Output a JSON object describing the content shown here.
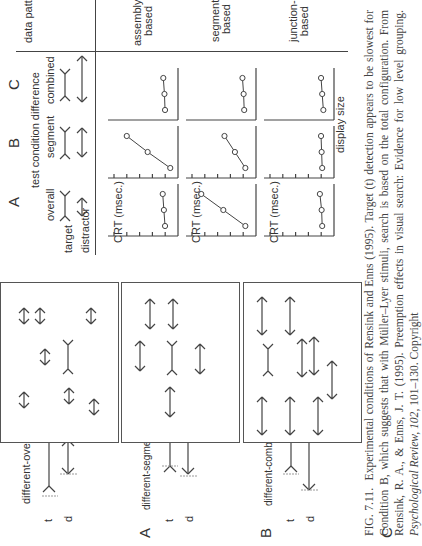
{
  "figure": {
    "conditions": [
      {
        "letter": "A",
        "name": "different-overall",
        "t_label": "t",
        "d_label": "d"
      },
      {
        "letter": "B",
        "name": "different-segment",
        "t_label": "t",
        "d_label": "d"
      },
      {
        "letter": "C",
        "name": "different-combined",
        "t_label": "t",
        "d_label": "d"
      }
    ],
    "table": {
      "header_test_condition": "test condition difference",
      "col_letters": [
        "A",
        "B",
        "C"
      ],
      "col_names": [
        "overall",
        "segment",
        "combined"
      ],
      "row_target": "target",
      "row_distractor": "distractor",
      "data_pattern_header": "data pattern",
      "patterns": [
        "assembly-based",
        "segment-based",
        "junction-based"
      ],
      "pattern_lines": [
        [
          "assembly-",
          "based"
        ],
        [
          "segment-",
          "based"
        ],
        [
          "junction-",
          "based"
        ]
      ],
      "y_axis_label": "CRT (msec.)",
      "x_axis_label": "display size"
    },
    "caption": {
      "fig_label": "FIG. 7.11.",
      "text_1": "Experimental conditions of Rensink and Enns (1995). Target (t) detection appears to be slowest for Condition B, which suggests that with Müller–Lyer stimuli, search is based on the total configuration. From Rensink, R. A., & Enns, J. T. (1995). Preemption effects in visual search: Evidence for low level grouping.",
      "journal": "Psychological Review, 102,",
      "text_2": "101–130. Copyright"
    }
  },
  "chart_data": {
    "type": "line",
    "xlabel": "display size",
    "ylabel": "CRT (msec.)",
    "x": [
      1,
      2,
      3
    ],
    "grid": false,
    "panels": [
      {
        "pattern": "assembly-based",
        "condition": "A overall",
        "values": [
          0.6,
          0.7,
          0.8
        ]
      },
      {
        "pattern": "assembly-based",
        "condition": "B segment",
        "values": [
          0.15,
          2.1,
          3.9
        ]
      },
      {
        "pattern": "assembly-based",
        "condition": "C combined",
        "values": [
          0.6,
          0.65,
          0.75
        ]
      },
      {
        "pattern": "segment-based",
        "condition": "A overall",
        "values": [
          0.4,
          2.3,
          4.2
        ]
      },
      {
        "pattern": "segment-based",
        "condition": "B segment",
        "values": [
          0.4,
          1.3,
          2.2
        ]
      },
      {
        "pattern": "segment-based",
        "condition": "C combined",
        "values": [
          0.5,
          0.55,
          0.65
        ]
      },
      {
        "pattern": "junction-based",
        "condition": "A overall",
        "values": [
          0.5,
          0.55,
          0.7
        ]
      },
      {
        "pattern": "junction-based",
        "condition": "B segment",
        "values": [
          0.5,
          0.55,
          0.6
        ]
      },
      {
        "pattern": "junction-based",
        "condition": "C combined",
        "values": [
          0.4,
          0.5,
          0.6
        ]
      }
    ],
    "ylim": [
      0,
      5
    ],
    "y_ticks": 5
  }
}
